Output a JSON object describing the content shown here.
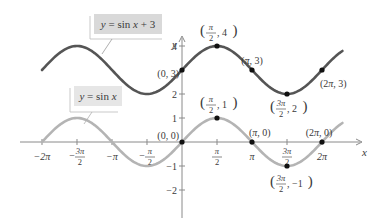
{
  "chart_data": {
    "type": "line",
    "title": "",
    "xlabel": "x",
    "ylabel": "y",
    "xlim": [
      -6.283,
      7.2
    ],
    "ylim": [
      -2.5,
      4.5
    ],
    "grid": false,
    "x_ticks": [
      {
        "value": -6.2832,
        "label": "−2π"
      },
      {
        "value": -4.7124,
        "label": "−3π/2"
      },
      {
        "value": -3.1416,
        "label": "−π"
      },
      {
        "value": -1.5708,
        "label": "−π/2"
      },
      {
        "value": 1.5708,
        "label": "π/2"
      },
      {
        "value": 3.1416,
        "label": "π"
      },
      {
        "value": 4.7124,
        "label": "3π/2"
      },
      {
        "value": 6.2832,
        "label": "2π"
      }
    ],
    "y_ticks": [
      {
        "value": 4,
        "label": "4"
      },
      {
        "value": 2,
        "label": "2"
      },
      {
        "value": 1,
        "label": "1"
      },
      {
        "value": -1,
        "label": "−1"
      },
      {
        "value": -2,
        "label": "−2"
      }
    ],
    "series": [
      {
        "name": "y = sin x + 3",
        "color": "#555555",
        "function": "sin(x) + 3",
        "domain": [
          -6.283,
          7.2
        ],
        "labeled_points": [
          {
            "x": 0,
            "y": 3,
            "label": "(0, 3)"
          },
          {
            "x": 1.5708,
            "y": 4,
            "label": "(π/2, 4)"
          },
          {
            "x": 3.1416,
            "y": 3,
            "label": "(π, 3)"
          },
          {
            "x": 4.7124,
            "y": 2,
            "label": "(3π/2, 2)"
          },
          {
            "x": 6.2832,
            "y": 3,
            "label": "(2π, 3)"
          }
        ]
      },
      {
        "name": "y = sin x",
        "color": "#b4b4b4",
        "function": "sin(x)",
        "domain": [
          -6.283,
          7.2
        ],
        "labeled_points": [
          {
            "x": 0,
            "y": 0,
            "label": "(0, 0)"
          },
          {
            "x": 1.5708,
            "y": 1,
            "label": "(π/2, 1)"
          },
          {
            "x": 3.1416,
            "y": 0,
            "label": "(π, 0)"
          },
          {
            "x": 4.7124,
            "y": -1,
            "label": "(3π/2, −1)"
          },
          {
            "x": 6.2832,
            "y": 0,
            "label": "(2π, 0)"
          }
        ]
      }
    ],
    "legend": [
      {
        "text": "y = sin x + 3",
        "series": 0
      },
      {
        "text": "y = sin x",
        "series": 1
      }
    ]
  },
  "labels": {
    "top_curve": "y = sin x + 3",
    "bottom_curve": "y = sin x",
    "x_axis": "x",
    "y_axis": "y"
  }
}
